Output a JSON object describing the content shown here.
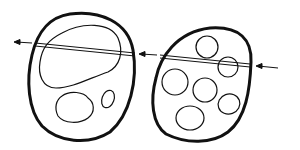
{
  "diagram": {
    "colors": {
      "background": "#ffffff",
      "stroke": "#111111"
    },
    "cells": [
      {
        "id": "cell-left",
        "contents": "one large vacuole, two small inclusions"
      },
      {
        "id": "cell-right",
        "contents": "six small vacuoles"
      }
    ],
    "arrows": [
      {
        "id": "arrow-left",
        "direction": "left"
      },
      {
        "id": "arrow-middle",
        "direction": "left"
      },
      {
        "id": "arrow-right",
        "direction": "left"
      }
    ]
  }
}
